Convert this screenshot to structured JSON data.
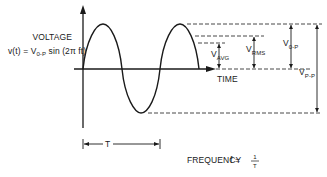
{
  "diagram": {
    "axis_labels": {
      "y": "VOLTAGE",
      "x": "TIME"
    },
    "equation": {
      "lhs": "v(t) = V",
      "sub": "0-P",
      "rhs": " sin (2π ft)"
    },
    "measurements": [
      {
        "name": "V",
        "sub": "AVG"
      },
      {
        "name": "V",
        "sub": "RMS"
      },
      {
        "name": "V",
        "sub": "0-P"
      },
      {
        "name": "V",
        "sub": "P-P"
      }
    ],
    "period_label": "T",
    "frequency": {
      "label": "FREQUENCY",
      "lhs": "f =",
      "numerator": "1",
      "denominator": "T"
    }
  }
}
